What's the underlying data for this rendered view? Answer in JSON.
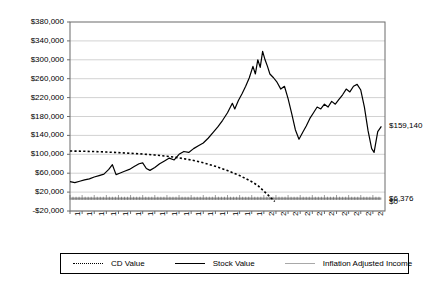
{
  "chart_data": {
    "type": "line",
    "title": "",
    "xlabel": "",
    "ylabel": "",
    "ylim": [
      -20000,
      380000
    ],
    "grid": true,
    "legend_position": "bottom",
    "categories": [
      "1984",
      "1985",
      "1986",
      "1987",
      "1988",
      "1989",
      "1990",
      "1991",
      "1992",
      "1993",
      "1994",
      "1995",
      "1996",
      "1997",
      "1998",
      "1999",
      "2000",
      "2001",
      "2002",
      "2003",
      "2004",
      "2005",
      "2006",
      "2007",
      "2008",
      "2009"
    ],
    "ytick_labels": [
      "$380,000",
      "$340,000",
      "$300,000",
      "$260,000",
      "$220,000",
      "$180,000",
      "$140,000",
      "$100,000",
      "$60,000",
      "$20,000",
      "-$20,000"
    ],
    "ytick_values": [
      380000,
      340000,
      300000,
      260000,
      220000,
      180000,
      140000,
      100000,
      60000,
      20000,
      -20000
    ],
    "right_labels": [
      {
        "text": "$159,140",
        "value": 159140
      },
      {
        "text": "$6,376",
        "value": 6376
      },
      {
        "text": "$0",
        "value": 0
      }
    ],
    "annotations": [
      {
        "text": "Inflation Adjusted Quarterly Income",
        "x": 1995.6,
        "y": 92000
      }
    ],
    "series": [
      {
        "name": "CD Value",
        "style": "dotted",
        "color": "#000000",
        "x": [
          1984.0,
          1985.0,
          1986.0,
          1987.0,
          1988.0,
          1989.0,
          1990.0,
          1991.0,
          1992.0,
          1993.0,
          1994.0,
          1995.0,
          1996.0,
          1997.0,
          1998.0,
          1999.0,
          1999.5,
          2000.0,
          2000.5,
          2000.9
        ],
        "values": [
          107000,
          106500,
          105800,
          104800,
          103500,
          102000,
          100500,
          98500,
          96000,
          92500,
          88000,
          82000,
          74500,
          65500,
          55000,
          42000,
          34000,
          22000,
          10000,
          0
        ]
      },
      {
        "name": "Stock Value",
        "style": "solid",
        "color": "#000000",
        "x": [
          1984.0,
          1984.4,
          1984.8,
          1985.2,
          1985.6,
          1986.0,
          1986.4,
          1986.8,
          1987.2,
          1987.5,
          1987.8,
          1988.1,
          1988.5,
          1988.9,
          1989.3,
          1989.7,
          1990.0,
          1990.3,
          1990.6,
          1991.0,
          1991.4,
          1991.8,
          1992.2,
          1992.6,
          1993.0,
          1993.4,
          1993.8,
          1994.2,
          1994.6,
          1995.0,
          1995.4,
          1995.8,
          1996.2,
          1996.6,
          1997.0,
          1997.4,
          1997.6,
          1997.9,
          1998.2,
          1998.5,
          1998.8,
          1999.1,
          1999.3,
          1999.5,
          1999.7,
          1999.9,
          2000.1,
          2000.3,
          2000.5,
          2000.8,
          2001.1,
          2001.4,
          2001.7,
          2002.0,
          2002.3,
          2002.6,
          2002.9,
          2003.2,
          2003.5,
          2003.8,
          2004.1,
          2004.4,
          2004.7,
          2005.0,
          2005.3,
          2005.6,
          2005.9,
          2006.2,
          2006.5,
          2006.8,
          2007.1,
          2007.4,
          2007.7,
          2008.0,
          2008.3,
          2008.6,
          2008.9,
          2009.1,
          2009.4,
          2009.7
        ],
        "values": [
          42000,
          40000,
          43000,
          46000,
          48000,
          52000,
          55000,
          58000,
          68000,
          78000,
          57000,
          60000,
          64000,
          68000,
          74000,
          80000,
          82000,
          70000,
          66000,
          72000,
          80000,
          86000,
          92000,
          88000,
          100000,
          106000,
          104000,
          112000,
          118000,
          124000,
          134000,
          146000,
          158000,
          172000,
          188000,
          208000,
          196000,
          214000,
          228000,
          244000,
          262000,
          286000,
          270000,
          300000,
          284000,
          318000,
          300000,
          286000,
          270000,
          262000,
          252000,
          238000,
          244000,
          218000,
          186000,
          152000,
          132000,
          146000,
          160000,
          176000,
          188000,
          200000,
          196000,
          206000,
          200000,
          212000,
          206000,
          216000,
          226000,
          238000,
          232000,
          244000,
          248000,
          236000,
          200000,
          150000,
          112000,
          104000,
          148000,
          159140
        ]
      },
      {
        "name": "Inflation Adjusted Income",
        "style": "solid-gray",
        "color": "#a8a8a8",
        "x": [
          1984.0,
          1988.0,
          1992.0,
          1996.0,
          2000.0,
          2004.0,
          2009.7
        ],
        "values": [
          6376,
          6376,
          6376,
          6376,
          6376,
          6376,
          6376
        ]
      }
    ]
  },
  "axis": {
    "left_labels": [
      "$380,000",
      "$340,000",
      "$300,000",
      "$260,000",
      "$220,000",
      "$180,000",
      "$140,000",
      "$100,000",
      "$60,000",
      "$20,000",
      "-$20,000"
    ],
    "x_labels": [
      "1984",
      "1985",
      "1986",
      "1987",
      "1988",
      "1989",
      "1990",
      "1991",
      "1992",
      "1993",
      "1994",
      "1995",
      "1996",
      "1997",
      "1998",
      "1999",
      "2000",
      "2001",
      "2002",
      "2003",
      "2004",
      "2005",
      "2006",
      "2007",
      "2008",
      "2009"
    ]
  },
  "legend": {
    "items": [
      {
        "label": "CD Value",
        "style": "dotted"
      },
      {
        "label": "Stock Value",
        "style": "solid"
      },
      {
        "label": "Inflation Adjusted Income",
        "style": "gray"
      }
    ]
  }
}
